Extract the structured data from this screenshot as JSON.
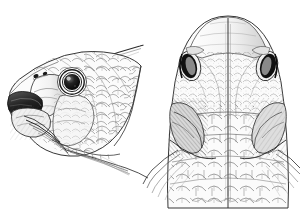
{
  "plate": {
    "title": "Fish head anatomical plate",
    "medium": "pen-and-ink scientific illustration",
    "background_color": "#ffffff",
    "ink_color": "#1d1d1d",
    "mid_tone_color": "#8d8d8d",
    "light_tone_color": "#c9c9c9",
    "width": 300,
    "height": 214,
    "figure_count": 2
  },
  "figures": [
    {
      "id": "lateral-view",
      "label": "Lateral view of fish head",
      "position": "left",
      "facing": "left",
      "bounds": {
        "x": 6,
        "y": 42,
        "width": 136,
        "height": 122
      },
      "parts": [
        {
          "name": "snout",
          "label": "Snout"
        },
        {
          "name": "upper-jaw",
          "label": "Upper jaw"
        },
        {
          "name": "lower-jaw",
          "label": "Lower jaw"
        },
        {
          "name": "nostrils",
          "label": "Nostrils",
          "count": 2
        },
        {
          "name": "eye",
          "label": "Eye",
          "cx": 72,
          "cy": 82,
          "r": 13
        },
        {
          "name": "preopercle",
          "label": "Preopercle"
        },
        {
          "name": "opercle",
          "label": "Opercle"
        },
        {
          "name": "cheek-scales",
          "label": "Cheek scales"
        },
        {
          "name": "body-scales",
          "label": "Body scales"
        },
        {
          "name": "dorsal-spine",
          "label": "Dorsal spine"
        },
        {
          "name": "pectoral-fin",
          "label": "Pectoral fin rays"
        },
        {
          "name": "branchiostegal-rays",
          "label": "Branchiostegal rays"
        }
      ]
    },
    {
      "id": "dorsal-view",
      "label": "Dorsal view of fish head",
      "position": "right",
      "facing": "up",
      "bounds": {
        "x": 150,
        "y": 14,
        "width": 146,
        "height": 200
      },
      "midline": 228,
      "parts": [
        {
          "name": "snout",
          "label": "Snout"
        },
        {
          "name": "frontal-plate",
          "label": "Frontal plate"
        },
        {
          "name": "midline-ridge",
          "label": "Midline ridge"
        },
        {
          "name": "eye-left",
          "label": "Left eye",
          "cx": 190,
          "cy": 66
        },
        {
          "name": "eye-right",
          "label": "Right eye",
          "cx": 267,
          "cy": 66
        },
        {
          "name": "opercle-left",
          "label": "Left opercle"
        },
        {
          "name": "opercle-right",
          "label": "Right opercle"
        },
        {
          "name": "nape-scales",
          "label": "Nape scales"
        },
        {
          "name": "body-scales",
          "label": "Body scales"
        },
        {
          "name": "pectoral-fin-left",
          "label": "Left pectoral fin"
        },
        {
          "name": "pectoral-fin-right",
          "label": "Right pectoral fin"
        }
      ]
    }
  ]
}
